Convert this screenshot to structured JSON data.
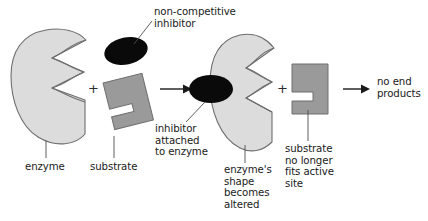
{
  "diagram": {
    "title_semantic": "non-competitive-inhibition-diagram",
    "background_color": "#ffffff",
    "colors": {
      "enzyme_fill": "#dcdcdc",
      "enzyme_stroke": "#6e6e6e",
      "substrate_fill": "#9a9a9a",
      "substrate_stroke": "#6e6e6e",
      "inhibitor_fill": "#0a0a0a",
      "text": "#1a1a1a",
      "arrow": "#1a1a1a",
      "leader_line": "#4d4d4d"
    },
    "labels": {
      "inhibitor_title_line1": "non-competitive",
      "inhibitor_title_line2": "inhibitor",
      "enzyme": "enzyme",
      "substrate": "substrate",
      "inhibitor_attached_line1": "inhibitor",
      "inhibitor_attached_line2": "attached",
      "inhibitor_attached_line3": "to enzyme",
      "enzyme_altered_line1": "enzyme's",
      "enzyme_altered_line2": "shape",
      "enzyme_altered_line3": "becomes",
      "enzyme_altered_line4": "altered",
      "substrate_nofit_line1": "substrate",
      "substrate_nofit_line2": "no longer",
      "substrate_nofit_line3": "fits active",
      "substrate_nofit_line4": "site",
      "no_end_products_line1": "no end",
      "no_end_products_line2": "products",
      "plus_one": "+",
      "plus_two": "+"
    },
    "shapes": [
      {
        "name": "enzyme-normal",
        "kind": "enzyme",
        "state": "normal"
      },
      {
        "name": "substrate-free",
        "kind": "substrate",
        "state": "unbound-rotated"
      },
      {
        "name": "inhibitor-free",
        "kind": "inhibitor",
        "state": "unbound"
      },
      {
        "name": "enzyme-altered",
        "kind": "enzyme",
        "state": "altered"
      },
      {
        "name": "inhibitor-bound",
        "kind": "inhibitor",
        "state": "bound"
      },
      {
        "name": "substrate-blocked",
        "kind": "substrate",
        "state": "cannot-bind"
      }
    ],
    "arrows": [
      {
        "name": "reaction-arrow-1",
        "from": "enzyme+substrate+inhibitor",
        "to": "enzyme-inhibitor-complex"
      },
      {
        "name": "reaction-arrow-2",
        "from": "complex+substrate",
        "to": "no end products"
      }
    ]
  }
}
